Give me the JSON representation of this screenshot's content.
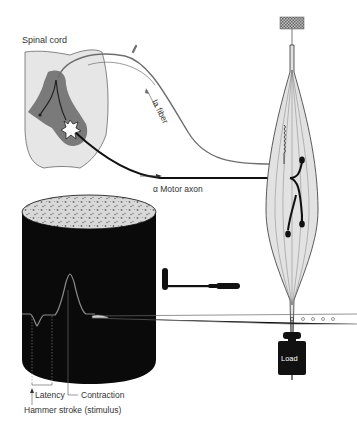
{
  "diagram": {
    "type": "stretch-reflex-kymograph",
    "labels": {
      "spinal_cord": "Spinal cord",
      "ia_fiber": "Ia fiber",
      "motor_axon": "α Motor axon",
      "latency": "Latency",
      "contraction": "Contraction",
      "hammer_stroke": "Hammer stroke (stimulus)",
      "load": "Load"
    },
    "colors": {
      "background": "#ffffff",
      "spinal_cord_white_matter": "#e6e6e6",
      "spinal_cord_gray_matter": "#7a7a7a",
      "ia_fiber": "#6e6e6e",
      "motor_axon": "#111111",
      "muscle_fill": "#e2e2e2",
      "drum": "#0a0a0a",
      "trace": "#8a8a8a"
    },
    "components": [
      {
        "id": "spinal-cord",
        "label_ref": "spinal_cord"
      },
      {
        "id": "ia-fiber",
        "label_ref": "ia_fiber"
      },
      {
        "id": "motor-axon",
        "label_ref": "motor_axon"
      },
      {
        "id": "muscle",
        "label_ref": null
      },
      {
        "id": "muscle-spindle",
        "label_ref": null
      },
      {
        "id": "reflex-hammer",
        "label_ref": null
      },
      {
        "id": "kymograph-drum",
        "label_ref": null
      },
      {
        "id": "lever-arm",
        "label_ref": null
      },
      {
        "id": "load-weight",
        "label_ref": "load"
      }
    ]
  }
}
